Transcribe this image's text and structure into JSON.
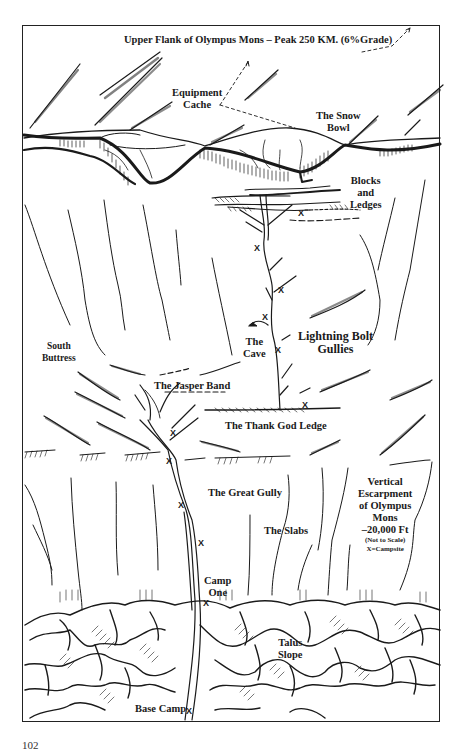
{
  "title": "Upper Flank of Olympus Mons – Peak 250 KM. (6%Grade)",
  "labels": {
    "equipment_cache": [
      "Equipment",
      "Cache"
    ],
    "snow_bowl": [
      "The Snow",
      "Bowl"
    ],
    "blocks_ledges": [
      "Blocks",
      "and",
      "Ledges"
    ],
    "south_buttress": [
      "South",
      "Buttress"
    ],
    "the_cave": [
      "The",
      "Cave"
    ],
    "lightning_bolt": [
      "Lightning Bolt",
      "Gullies"
    ],
    "jasper_band": "The Jasper Band",
    "thank_god_ledge": "The Thank God Ledge",
    "great_gully": "The Great Gully",
    "slabs": "The Slabs",
    "escarpment": [
      "Vertical",
      "Escarpment",
      "of Olympus",
      "Mons",
      "–20,000 Ft"
    ],
    "not_to_scale": "(Not to Scale)",
    "legend_campsite": "X=Campsite",
    "camp_one": [
      "Camp",
      "One"
    ],
    "talus_slope": [
      "Talus",
      "Slope"
    ],
    "base_camp": "Base Camp"
  },
  "campsite_marker": "X",
  "campsites": [
    {
      "x": 298,
      "y": 208
    },
    {
      "x": 254,
      "y": 243
    },
    {
      "x": 278,
      "y": 285
    },
    {
      "x": 262,
      "y": 312
    },
    {
      "x": 275,
      "y": 345
    },
    {
      "x": 302,
      "y": 400
    },
    {
      "x": 170,
      "y": 428
    },
    {
      "x": 166,
      "y": 456
    },
    {
      "x": 178,
      "y": 500
    },
    {
      "x": 198,
      "y": 538
    },
    {
      "x": 203,
      "y": 598
    },
    {
      "x": 186,
      "y": 706
    }
  ],
  "page_number": "102"
}
